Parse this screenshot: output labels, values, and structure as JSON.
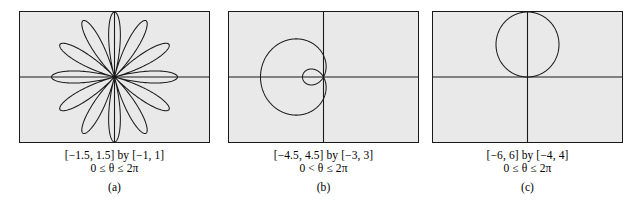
{
  "figure": {
    "background_color": "#ffffff",
    "panel_fill_color": "#e9e9e9",
    "curve_color": "#1a1a1a",
    "axis_color": "#1a1a1a"
  },
  "panels": [
    {
      "id": "a",
      "label": "(a)",
      "window": "[−1.5, 1.5] by [−1, 1]",
      "range": "0 ≤ θ ≤ 2π",
      "curve_name": "twelve-petal-rose",
      "curve_description": "12-petaled rose centered at the origin"
    },
    {
      "id": "b",
      "label": "(b)",
      "window": "[−4.5, 4.5] by [−3, 3]",
      "range": "0 < θ ≤ 2π",
      "curve_name": "limacon-with-inner-loop",
      "curve_description": "Limaçon opening to the left with a small inner loop at the origin"
    },
    {
      "id": "c",
      "label": "(c)",
      "window": "[−6, 6] by [−4, 4]",
      "range": "0 ≤ θ ≤ 2π",
      "curve_name": "circle-tangent-to-x-axis",
      "curve_description": "Circle centered on the positive y-axis, tangent to the x-axis at the origin"
    }
  ],
  "chart_data": [
    {
      "type": "line",
      "title": "",
      "panel": "a",
      "polar": true,
      "equation": "r = cos(6θ)",
      "petals": 12,
      "theta_range": [
        0,
        6.283185
      ],
      "xlim": [
        -1.5,
        1.5
      ],
      "ylim": [
        -1,
        1
      ],
      "xlabel": "",
      "ylabel": "",
      "grid": false,
      "axes_through_origin": true
    },
    {
      "type": "line",
      "title": "",
      "panel": "b",
      "polar": true,
      "equation": "r = 1 − 2 cos θ",
      "theta_range": [
        0,
        6.283185
      ],
      "xlim": [
        -4.5,
        4.5
      ],
      "ylim": [
        -3,
        3
      ],
      "xlabel": "",
      "ylabel": "",
      "grid": false,
      "axes_through_origin": true
    },
    {
      "type": "line",
      "title": "",
      "panel": "c",
      "polar": true,
      "equation": "r = 4 sin θ",
      "theta_range": [
        0,
        6.283185
      ],
      "xlim": [
        -6,
        6
      ],
      "ylim": [
        -4,
        4
      ],
      "xlabel": "",
      "ylabel": "",
      "grid": false,
      "axes_through_origin": true
    }
  ]
}
